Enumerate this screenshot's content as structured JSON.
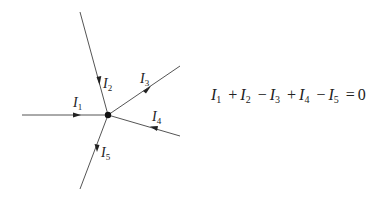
{
  "diagram": {
    "node": {
      "x": 108,
      "y": 115
    },
    "branches": [
      {
        "id": "I1",
        "symbol": "I",
        "subscript": "1",
        "direction": "in",
        "end": {
          "x": 22,
          "y": 115
        },
        "label_pos": {
          "x": 73,
          "y": 96
        }
      },
      {
        "id": "I2",
        "symbol": "I",
        "subscript": "2",
        "direction": "in",
        "end": {
          "x": 80,
          "y": 12
        },
        "label_pos": {
          "x": 103,
          "y": 77
        }
      },
      {
        "id": "I3",
        "symbol": "I",
        "subscript": "3",
        "direction": "out",
        "end": {
          "x": 180,
          "y": 66
        },
        "label_pos": {
          "x": 140,
          "y": 72
        }
      },
      {
        "id": "I4",
        "symbol": "I",
        "subscript": "4",
        "direction": "in",
        "end": {
          "x": 180,
          "y": 136
        },
        "label_pos": {
          "x": 152,
          "y": 110
        }
      },
      {
        "id": "I5",
        "symbol": "I",
        "subscript": "5",
        "direction": "out",
        "end": {
          "x": 80,
          "y": 189
        },
        "label_pos": {
          "x": 101,
          "y": 146
        }
      }
    ],
    "line_color": "#555555",
    "node_color": "#111111"
  },
  "equation": {
    "terms": [
      {
        "sign": "",
        "symbol": "I",
        "subscript": "1"
      },
      {
        "sign": "+",
        "symbol": "I",
        "subscript": "2"
      },
      {
        "sign": "−",
        "symbol": "I",
        "subscript": "3"
      },
      {
        "sign": "+",
        "symbol": "I",
        "subscript": "4"
      },
      {
        "sign": "−",
        "symbol": "I",
        "subscript": "5"
      }
    ],
    "equals": "=",
    "rhs": "0",
    "text": "I1 + I2 − I3 + I4 − I5 = 0"
  },
  "labels": {
    "I1": {
      "symbol": "I",
      "sub": "1"
    },
    "I2": {
      "symbol": "I",
      "sub": "2"
    },
    "I3": {
      "symbol": "I",
      "sub": "3"
    },
    "I4": {
      "symbol": "I",
      "sub": "4"
    },
    "I5": {
      "symbol": "I",
      "sub": "5"
    }
  }
}
